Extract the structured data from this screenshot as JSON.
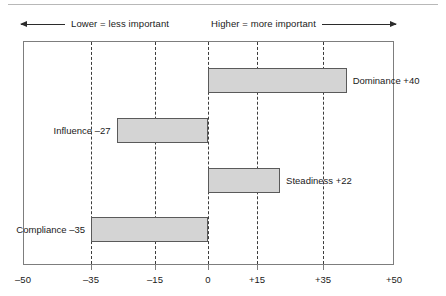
{
  "legend": {
    "left_text": "Lower = less important",
    "right_text": "Higher = more important",
    "left_arrow_icon": "arrow-left-icon",
    "right_arrow_icon": "arrow-right-icon"
  },
  "chart_data": {
    "type": "bar",
    "orientation": "horizontal",
    "title": "",
    "subtitle": "",
    "xlabel": "",
    "ylabel": "",
    "categories": [
      "Dominance",
      "Influence",
      "Steadiness",
      "Compliance"
    ],
    "values": [
      40,
      -27,
      22,
      -35
    ],
    "data_labels": [
      "Dominance +40",
      "Influence –27",
      "Steadiness +22",
      "Compliance –35"
    ],
    "series": [
      {
        "name": "DiSC score",
        "values": [
          40,
          -27,
          22,
          -35
        ]
      }
    ],
    "xlim": [
      -50,
      50
    ],
    "xticks": [
      -50,
      -35,
      -15,
      0,
      15,
      35,
      50
    ],
    "xtick_labels": [
      "–50",
      "–35",
      "–15",
      "0",
      "+15",
      "+35",
      "+50"
    ],
    "gridlines_at": [
      -35,
      -15,
      0,
      15,
      35
    ],
    "grid": true,
    "legend_position": "none",
    "bar_fill": "#d4d4d4",
    "bar_stroke": "#5a5a5a",
    "frame_stroke": "#7d7d7d",
    "annotations": [
      "Lower = less important",
      "Higher = more important"
    ]
  }
}
